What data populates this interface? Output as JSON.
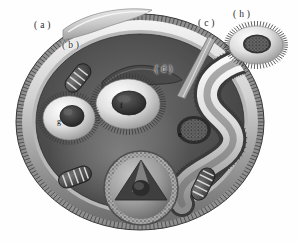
{
  "figure": {
    "style": "grayscale airbrushed scientific illustration",
    "background_color": "#fefefe",
    "palette": {
      "outline": "#2a2a2a",
      "cytoplasm_dark": "#4e4e4e",
      "cytoplasm_mid": "#676767",
      "membrane_light": "#e2e2e2",
      "membrane_mid": "#9c9c9c",
      "highlight": "#f2f2f2",
      "organelle_dark": "#343434",
      "label_text": "#2a2a2a"
    }
  },
  "labels": [
    {
      "id": "a",
      "text": "( a )",
      "x": 34,
      "y": 20,
      "target": "outer-flap-layer"
    },
    {
      "id": "b",
      "text": "( b )",
      "x": 62,
      "y": 40,
      "target": "ciliated-membrane-band"
    },
    {
      "id": "c",
      "text": "( c )",
      "x": 198,
      "y": 18,
      "target": "projecting-stalk"
    },
    {
      "id": "d",
      "text": "( d )",
      "x": 155,
      "y": 64,
      "target": "flattened-sheet-body"
    },
    {
      "id": "e",
      "text": "e",
      "x": 178,
      "y": 130,
      "target": "granular-core-vesicle"
    },
    {
      "id": "f",
      "text": "f",
      "x": 120,
      "y": 101,
      "target": "central-ring-organelle"
    },
    {
      "id": "g",
      "text": "g",
      "x": 57,
      "y": 117,
      "target": "left-ring-organelle"
    },
    {
      "id": "h",
      "text": "( h )",
      "x": 233,
      "y": 9,
      "target": "detached-ring-inset"
    }
  ],
  "structures": {
    "cell_body": {
      "name": "cell-body-outline",
      "shape": "large ovoid, ciliated rim"
    },
    "outer_flap": {
      "name": "outer-flap-layer",
      "shape": "light crescent flap, top-left"
    },
    "membrane_band": {
      "name": "ciliated-membrane-band",
      "shape": "bright banded rim with radiating cilia"
    },
    "stalk": {
      "name": "projecting-stalk",
      "shape": "tapered rod crossing the upper-right rim"
    },
    "sheet_body": {
      "name": "flattened-sheet-body",
      "shape": "dark wavy flattened sheet, upper-middle"
    },
    "central_ring": {
      "name": "central-ring-organelle",
      "shape": "ciliated torus with dark oval core"
    },
    "left_ring": {
      "name": "left-ring-organelle",
      "shape": "ciliated torus with dark round core"
    },
    "granular_vesicle": {
      "name": "granular-core-vesicle",
      "shape": "dotted granular ball inside tubular channel"
    },
    "tubular_channel": {
      "name": "tubular-channel",
      "shape": "bright serpentine tube winding at right"
    },
    "triangular_organelle": {
      "name": "triangular-core-body",
      "shape": "speckled disc with triangular aperture, bottom"
    },
    "coils": {
      "name": "coiled-ladder-organelles",
      "count": 3,
      "positions": [
        "upper-left",
        "lower-left",
        "lower-right"
      ],
      "shape": "oblong body with transverse ladder-like cristae"
    },
    "inset_ring": {
      "name": "detached-ring-inset",
      "shape": "isolated ciliated ring with granular center"
    }
  }
}
